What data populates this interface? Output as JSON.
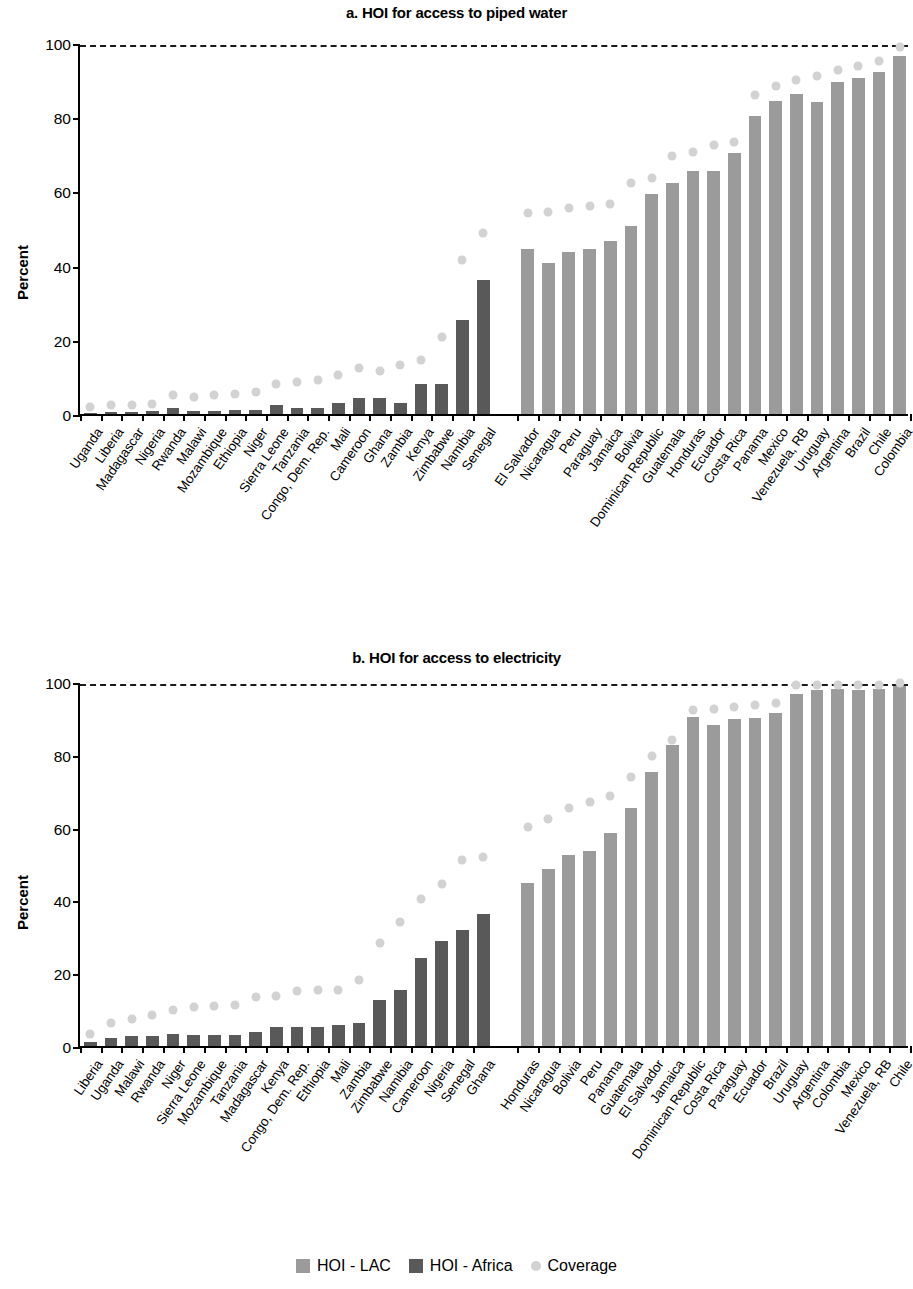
{
  "legend": {
    "items": [
      {
        "label": "HOI - LAC",
        "key": "lac",
        "color": "#9b9b9b",
        "shape": "square"
      },
      {
        "label": "HOI - Africa",
        "key": "afr",
        "color": "#595959",
        "shape": "square"
      },
      {
        "label": "Coverage",
        "key": "cov",
        "color": "#d2d2d2",
        "shape": "circle"
      }
    ]
  },
  "chart_data": [
    {
      "type": "bar",
      "title": "a. HOI for access to piped water",
      "xlabel": "",
      "ylabel": "Percent",
      "ylim": [
        0,
        100
      ],
      "yticks": [
        0,
        20,
        40,
        60,
        80,
        100
      ],
      "grid": false,
      "reference_line": {
        "value": 100,
        "style": "dashed"
      },
      "legend_position": "bottom",
      "groups": [
        {
          "name": "HOI - Africa",
          "color": "#595959"
        },
        {
          "name": "HOI - LAC",
          "color": "#9b9b9b"
        }
      ],
      "categories": [
        "Uganda",
        "Liberia",
        "Madagascar",
        "Nigeria",
        "Rwanda",
        "Malawi",
        "Mozambique",
        "Ethiopia",
        "Niger",
        "Sierra Leone",
        "Tanzania",
        "Congo, Dem. Rep.",
        "Mali",
        "Cameroon",
        "Ghana",
        "Zambia",
        "Kenya",
        "Zimbabwe",
        "Namibia",
        "Senegal",
        "El Salvador",
        "Nicaragua",
        "Peru",
        "Paraguay",
        "Jamaica",
        "Bolivia",
        "Dominican Republic",
        "Guatemala",
        "Honduras",
        "Ecuador",
        "Costa Rica",
        "Panama",
        "Mexico",
        "Venezuela, RB",
        "Uruguay",
        "Argentina",
        "Brazil",
        "Chile",
        "Colombia"
      ],
      "category_groups": [
        "afr",
        "afr",
        "afr",
        "afr",
        "afr",
        "afr",
        "afr",
        "afr",
        "afr",
        "afr",
        "afr",
        "afr",
        "afr",
        "afr",
        "afr",
        "afr",
        "afr",
        "afr",
        "afr",
        "afr",
        "lac",
        "lac",
        "lac",
        "lac",
        "lac",
        "lac",
        "lac",
        "lac",
        "lac",
        "lac",
        "lac",
        "lac",
        "lac",
        "lac",
        "lac",
        "lac",
        "lac",
        "lac",
        "lac"
      ],
      "series": [
        {
          "name": "HOI",
          "values": [
            0.4,
            0.6,
            0.6,
            0.7,
            1.6,
            0.8,
            0.9,
            1.0,
            1.2,
            2.4,
            1.5,
            1.6,
            3.0,
            4.4,
            4.4,
            2.9,
            8.1,
            8.1,
            25.3,
            36.1,
            44.6,
            40.7,
            43.6,
            44.6,
            46.6,
            50.7,
            59.4,
            62.4,
            65.4,
            65.4,
            70.3,
            80.3,
            84.4,
            86.3,
            84.0,
            89.6,
            90.6,
            92.2,
            96.5
          ]
        },
        {
          "name": "Coverage",
          "values": [
            1.8,
            2.4,
            2.3,
            2.8,
            5.0,
            4.7,
            5.0,
            5.3,
            5.9,
            8.2,
            8.7,
            9.1,
            10.6,
            12.3,
            11.5,
            13.3,
            14.5,
            20.8,
            41.6,
            48.9,
            54.3,
            54.5,
            55.6,
            56.0,
            56.5,
            62.3,
            63.6,
            69.5,
            70.5,
            72.6,
            73.2,
            85.9,
            88.5,
            90.0,
            91.0,
            92.6,
            93.8,
            95.2,
            98.8
          ]
        }
      ]
    },
    {
      "type": "bar",
      "title": "b. HOI for access to electricity",
      "xlabel": "",
      "ylabel": "Percent",
      "ylim": [
        0,
        100
      ],
      "yticks": [
        0,
        20,
        40,
        60,
        80,
        100
      ],
      "grid": false,
      "reference_line": {
        "value": 100,
        "style": "dashed"
      },
      "legend_position": "bottom",
      "groups": [
        {
          "name": "HOI - Africa",
          "color": "#595959"
        },
        {
          "name": "HOI - LAC",
          "color": "#9b9b9b"
        }
      ],
      "categories": [
        "Liberia",
        "Uganda",
        "Malawi",
        "Rwanda",
        "Niger",
        "Sierra Leone",
        "Mozambique",
        "Tanzania",
        "Madagascar",
        "Kenya",
        "Congo, Dem. Rep.",
        "Ethiopia",
        "Mali",
        "Zambia",
        "Zimbabwe",
        "Namibia",
        "Cameroon",
        "Nigeria",
        "Senegal",
        "Ghana",
        "Honduras",
        "Nicaragua",
        "Bolivia",
        "Peru",
        "Panama",
        "Guatemala",
        "El Salvador",
        "Jamaica",
        "Dominican Republic",
        "Costa Rica",
        "Paraguay",
        "Ecuador",
        "Brazil",
        "Uruguay",
        "Argentina",
        "Colombia",
        "Mexico",
        "Venezuela, RB",
        "Chile"
      ],
      "category_groups": [
        "afr",
        "afr",
        "afr",
        "afr",
        "afr",
        "afr",
        "afr",
        "afr",
        "afr",
        "afr",
        "afr",
        "afr",
        "afr",
        "afr",
        "afr",
        "afr",
        "afr",
        "afr",
        "afr",
        "afr",
        "lac",
        "lac",
        "lac",
        "lac",
        "lac",
        "lac",
        "lac",
        "lac",
        "lac",
        "lac",
        "lac",
        "lac",
        "lac",
        "lac",
        "lac",
        "lac",
        "lac",
        "lac",
        "lac"
      ],
      "series": [
        {
          "name": "HOI",
          "values": [
            1.1,
            2.3,
            2.7,
            2.7,
            3.2,
            3.1,
            2.9,
            2.9,
            3.9,
            5.2,
            5.3,
            5.3,
            5.7,
            6.3,
            12.6,
            15.5,
            24.1,
            28.9,
            31.9,
            36.2,
            44.7,
            48.5,
            52.6,
            53.6,
            58.6,
            65.3,
            75.3,
            82.6,
            90.4,
            88.3,
            89.8,
            90.0,
            91.5,
            96.7,
            97.9,
            98.0,
            97.8,
            98.1,
            99.0
          ]
        },
        {
          "name": "Coverage",
          "values": [
            3.2,
            6.3,
            7.5,
            8.5,
            9.8,
            10.8,
            10.9,
            11.4,
            13.6,
            13.8,
            15.1,
            15.3,
            15.4,
            18.1,
            28.4,
            34.1,
            40.4,
            44.4,
            51.2,
            51.8,
            60.2,
            62.5,
            65.4,
            67.0,
            68.6,
            73.9,
            79.8,
            84.2,
            92.2,
            92.5,
            93.0,
            93.8,
            94.2,
            99.1,
            99.2,
            99.3,
            99.2,
            99.3,
            99.6
          ]
        }
      ]
    }
  ]
}
